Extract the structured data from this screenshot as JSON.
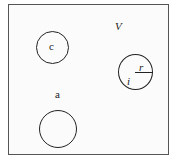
{
  "diagram": {
    "region_label": "V",
    "labels": {
      "circle_c": "c",
      "point_a": "a",
      "radius": "r",
      "circle_i": "i"
    }
  }
}
